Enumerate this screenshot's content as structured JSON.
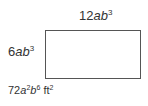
{
  "diagram": {
    "shape": "rectangle",
    "top_label": {
      "coef": "12",
      "vars": [
        {
          "v": "a",
          "exp": ""
        },
        {
          "v": "b",
          "exp": "3"
        }
      ],
      "text": "12ab^3"
    },
    "left_label": {
      "coef": "6",
      "vars": [
        {
          "v": "a",
          "exp": ""
        },
        {
          "v": "b",
          "exp": "3"
        }
      ],
      "text": "6ab^3"
    },
    "area_label": {
      "coef": "72",
      "vars": [
        {
          "v": "a",
          "exp": "2"
        },
        {
          "v": "b",
          "exp": "6"
        }
      ],
      "unit": "ft",
      "unit_exp": "2",
      "text": "72a^2b^6 ft^2"
    }
  }
}
